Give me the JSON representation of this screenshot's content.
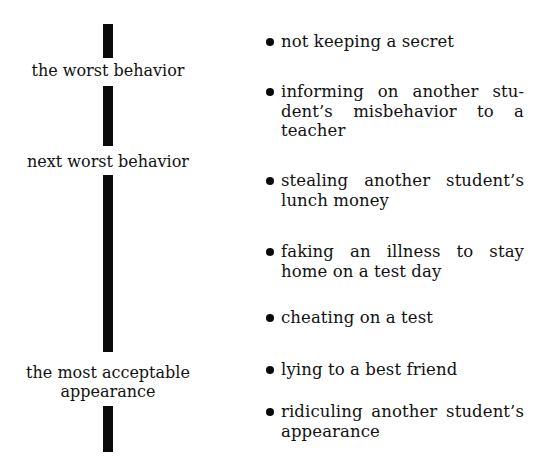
{
  "scale": {
    "labels": [
      "the worst behavior",
      "next worst behavior",
      "the most acceptable appearance"
    ],
    "label_lines": {
      "worst": "the worst behavior",
      "next_worst": "next worst behavior",
      "most_acceptable_line1": "the most acceptable",
      "most_acceptable_line2": "appearance"
    }
  },
  "behaviors": [
    {
      "text": "not keeping a secret"
    },
    {
      "text": "informing on another stu­dent’s misbehavior to a teacher"
    },
    {
      "text": "stealing another student’s lunch money"
    },
    {
      "text": "faking an illness to stay home on a test day"
    },
    {
      "text": "cheating on a test"
    },
    {
      "text": "lying to a best friend"
    },
    {
      "text": "ridiculing another student’s appearance"
    }
  ],
  "colors": {
    "ink": "#0a0a0a",
    "background": "#ffffff"
  }
}
